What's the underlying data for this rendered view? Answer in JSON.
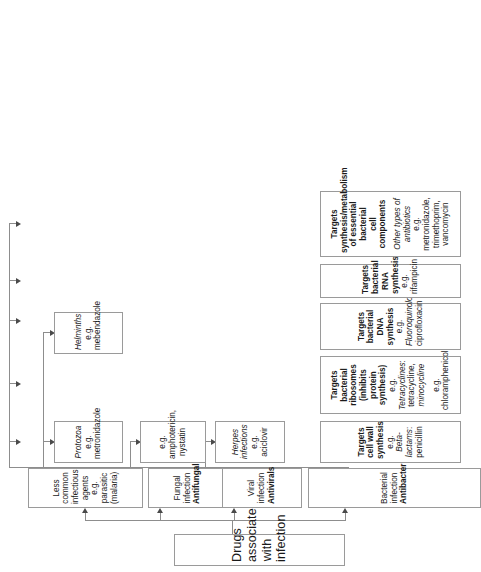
{
  "diagram": {
    "type": "flowchart",
    "orientation": "rotated-90-ccw",
    "root": {
      "label": "Drugs associated with infection"
    },
    "branches": [
      {
        "id": "bacterial",
        "title_line1": "Bacterial infection",
        "title_line2": "Antibacterials",
        "children": [
          {
            "id": "cell-wall",
            "line1": "Targets cell wall synthesis",
            "line2_prefix": "e.g. ",
            "line2_italic": "Beta-lactams",
            "line2_suffix": ": penicillin"
          },
          {
            "id": "ribosomes",
            "line1": "Targets bacterial ribosomes",
            "line2": "(inhibits protein synthesis)",
            "line3_prefix": "e.g. ",
            "line3_italic": "Tetracyclines",
            "line3_suffix": ": tetracycline,",
            "line4": "minocycline",
            "line5": "e.g. chloramphenicol"
          },
          {
            "id": "dna",
            "line1": "Targets bacterial DNA synthesis",
            "line2_prefix": "e.g. ",
            "line2_italic": "Fluoroquinolones",
            "line2_suffix": ":",
            "line3": "ciprofloxacin"
          },
          {
            "id": "rna",
            "line1": "Targets bacterial RNA synthesis",
            "line2": "e.g. rifampicin"
          },
          {
            "id": "metabolism",
            "line1": "Targets synthesis/metabolism",
            "line2": "of essential bacterial",
            "line3": "cell components",
            "line4_italic": "Other types of antibiotics",
            "line5": "e.g. metronidazole, trimethoprim,",
            "line6": "vancomycin"
          }
        ]
      },
      {
        "id": "viral",
        "title_line1": "Viral infection",
        "title_line2": "Antivirals",
        "children": [
          {
            "id": "herpes",
            "line1_italic": "Herpes infections",
            "line2": "e.g. aciclovir"
          }
        ]
      },
      {
        "id": "fungal",
        "title_line1": "Fungal infection",
        "title_line2": "Antifungals",
        "children": [
          {
            "id": "amphotericin",
            "line1": "e.g. amphotericin,",
            "line2": "nystatin"
          }
        ]
      },
      {
        "id": "less-common",
        "title_line1": "Less common infectious",
        "title_line2": "agents",
        "title_line3": "e.g. parasitic (malaria)",
        "children": [
          {
            "id": "protozoa",
            "line1_italic": "Protozoa",
            "line2": "e.g. metronidazole"
          },
          {
            "id": "helminths",
            "line1_italic": "Helminths",
            "line2": "e.g. mebendazole"
          }
        ]
      }
    ],
    "colors": {
      "box_border": "#9a9a9a",
      "connector": "#8d8d8d",
      "arrow": "#4a4a4a",
      "background": "#ffffff",
      "text": "#1a1a1a"
    }
  }
}
